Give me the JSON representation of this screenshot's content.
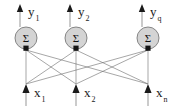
{
  "figure": {
    "background_color": "#ffffff",
    "line_color": "#6b6b6b",
    "arrow_color": "#1a1a1a",
    "neuron_fill": "#d4d4d4",
    "neuron_stroke": "#7a7a7a",
    "text_color": "#1a1a1a"
  },
  "neurons": [
    {
      "id": "neuron-1",
      "glyph": "Σ",
      "cx": 26,
      "cy": 38,
      "r": 11
    },
    {
      "id": "neuron-2",
      "glyph": "Σ",
      "cx": 76,
      "cy": 38,
      "r": 11
    },
    {
      "id": "neuron-q",
      "glyph": "Σ",
      "cx": 148,
      "cy": 38,
      "r": 11
    }
  ],
  "outputs": [
    {
      "id": "output-y1",
      "base": "y",
      "sub": "1",
      "x": 20,
      "arrow_tip_y": 4,
      "arrow_base_y": 27,
      "label_x": 28,
      "label_y": 16
    },
    {
      "id": "output-y2",
      "base": "y",
      "sub": "2",
      "x": 70,
      "arrow_tip_y": 4,
      "arrow_base_y": 27,
      "label_x": 78,
      "label_y": 16
    },
    {
      "id": "output-yq",
      "base": "y",
      "sub": "q",
      "x": 142,
      "arrow_tip_y": 4,
      "arrow_base_y": 27,
      "label_x": 150,
      "label_y": 16
    }
  ],
  "inputs": [
    {
      "id": "input-x1",
      "base": "x",
      "sub": "1",
      "x": 26,
      "arrow_tip_y": 84,
      "arrow_base_y": 106,
      "label_x": 34,
      "label_y": 97
    },
    {
      "id": "input-x2",
      "base": "x",
      "sub": "2",
      "x": 76,
      "arrow_tip_y": 84,
      "arrow_base_y": 106,
      "label_x": 84,
      "label_y": 97
    },
    {
      "id": "input-xn",
      "base": "x",
      "sub": "n",
      "x": 148,
      "arrow_tip_y": 84,
      "arrow_base_y": 106,
      "label_x": 156,
      "label_y": 97
    }
  ],
  "connections": [
    {
      "from": "input-x1",
      "to": "neuron-1",
      "x1": 26,
      "y1": 84,
      "x2": 26,
      "y2": 50
    },
    {
      "from": "input-x1",
      "to": "neuron-2",
      "x1": 26,
      "y1": 84,
      "x2": 76,
      "y2": 50
    },
    {
      "from": "input-x1",
      "to": "neuron-q",
      "x1": 26,
      "y1": 84,
      "x2": 148,
      "y2": 50
    },
    {
      "from": "input-x2",
      "to": "neuron-1",
      "x1": 76,
      "y1": 84,
      "x2": 26,
      "y2": 50
    },
    {
      "from": "input-x2",
      "to": "neuron-2",
      "x1": 76,
      "y1": 84,
      "x2": 76,
      "y2": 50
    },
    {
      "from": "input-x2",
      "to": "neuron-q",
      "x1": 76,
      "y1": 84,
      "x2": 148,
      "y2": 50
    },
    {
      "from": "input-xn",
      "to": "neuron-1",
      "x1": 148,
      "y1": 84,
      "x2": 26,
      "y2": 50
    },
    {
      "from": "input-xn",
      "to": "neuron-2",
      "x1": 148,
      "y1": 84,
      "x2": 76,
      "y2": 50
    },
    {
      "from": "input-xn",
      "to": "neuron-q",
      "x1": 148,
      "y1": 84,
      "x2": 148,
      "y2": 50
    }
  ],
  "synapse_heads": [
    {
      "id": "synapse-head-1",
      "x": 26,
      "y": 50
    },
    {
      "id": "synapse-head-2",
      "x": 76,
      "y": 50
    },
    {
      "id": "synapse-head-q",
      "x": 148,
      "y": 50
    }
  ]
}
